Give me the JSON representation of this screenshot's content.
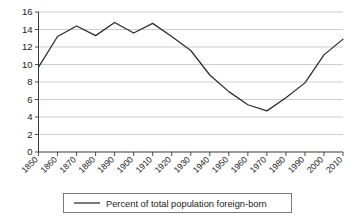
{
  "chart_data": {
    "type": "line",
    "title": "",
    "xlabel": "",
    "ylabel": "",
    "x": [
      1850,
      1860,
      1870,
      1880,
      1890,
      1900,
      1910,
      1920,
      1930,
      1940,
      1950,
      1960,
      1970,
      1980,
      1990,
      2000,
      2010
    ],
    "categories": [
      "1850",
      "1860",
      "1870",
      "1880",
      "1890",
      "1900",
      "1910",
      "1920",
      "1930",
      "1940",
      "1950",
      "1960",
      "1970",
      "1980",
      "1990",
      "2000",
      "2010"
    ],
    "series": [
      {
        "name": "Percent of total population foreign-born",
        "values": [
          9.7,
          13.2,
          14.4,
          13.3,
          14.8,
          13.6,
          14.7,
          13.2,
          11.6,
          8.8,
          6.9,
          5.4,
          4.7,
          6.2,
          7.9,
          11.1,
          12.9
        ],
        "color": "#2b2b2b"
      }
    ],
    "ylim": [
      0,
      16
    ],
    "yticks": [
      0,
      2,
      4,
      6,
      8,
      10,
      12,
      14,
      16
    ],
    "ytick_labels": [
      "0",
      "2",
      "4",
      "6",
      "8",
      "10",
      "12",
      "14",
      "16"
    ],
    "xlim": [
      1850,
      2010
    ],
    "grid": "horizontal",
    "legend_position": "bottom",
    "legend_entries": [
      "Percent of total population foreign-born"
    ]
  },
  "legend": {
    "entry_label": "Percent of total population foreign-born"
  },
  "colors": {
    "line": "#2b2b2b",
    "gridline": "#b8b8b8",
    "axis": "#3a3a3a",
    "text": "#1a1a1a",
    "background": "#ffffff",
    "legend_border": "#5a5a5a"
  }
}
